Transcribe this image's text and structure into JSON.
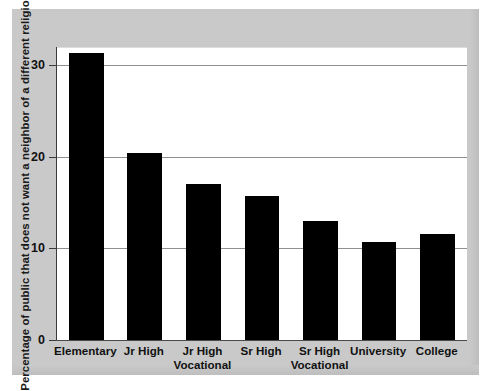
{
  "chart_data": {
    "type": "bar",
    "title": "",
    "subtitle": "",
    "xlabel": "",
    "ylabel": "Percentage of public that does not want a neighbor of a different religion",
    "categories": [
      "Elementary",
      "Jr High",
      "Jr High Vocational",
      "Sr High",
      "Sr High Vocational",
      "University",
      "College"
    ],
    "category_lines": [
      [
        "Elementary"
      ],
      [
        "Jr High"
      ],
      [
        "Jr High",
        "Vocational"
      ],
      [
        "Sr High"
      ],
      [
        "Sr High",
        "Vocational"
      ],
      [
        "University"
      ],
      [
        "College"
      ]
    ],
    "values": [
      31.3,
      20.4,
      17.0,
      15.7,
      13.0,
      10.7,
      11.6
    ],
    "ylim": [
      0,
      32
    ],
    "yticks": [
      0,
      10,
      20,
      30
    ],
    "ytick_labels": [
      "0",
      "10",
      "20",
      "30"
    ],
    "gridlines_y": [
      10,
      20,
      30
    ],
    "grid": true,
    "legend": "none",
    "bar_color": "#000000",
    "plot_background": "#ffffff",
    "figure_background": "#c9c9c9",
    "axis_color": "#3a3a3a",
    "gridline_color": "#8f8f8f"
  }
}
